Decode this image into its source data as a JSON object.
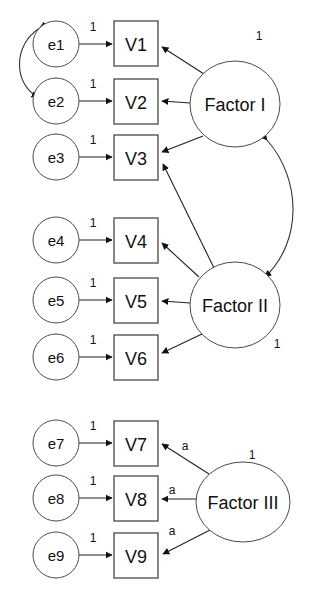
{
  "diagram": {
    "background_color": "#ffffff",
    "line_color": "#222222",
    "shape_fill": "#ffffff",
    "errors": [
      {
        "id": "e1",
        "label": "e1",
        "cx": 56,
        "cy": 44,
        "rx": 23,
        "ry": 23
      },
      {
        "id": "e2",
        "label": "e2",
        "cx": 56,
        "cy": 101,
        "rx": 23,
        "ry": 23
      },
      {
        "id": "e3",
        "label": "e3",
        "cx": 56,
        "cy": 157,
        "rx": 23,
        "ry": 23
      },
      {
        "id": "e4",
        "label": "e4",
        "cx": 56,
        "cy": 240,
        "rx": 23,
        "ry": 23
      },
      {
        "id": "e5",
        "label": "e5",
        "cx": 56,
        "cy": 300,
        "rx": 23,
        "ry": 23
      },
      {
        "id": "e6",
        "label": "e6",
        "cx": 56,
        "cy": 357,
        "rx": 23,
        "ry": 23
      },
      {
        "id": "e7",
        "label": "e7",
        "cx": 56,
        "cy": 443,
        "rx": 23,
        "ry": 23
      },
      {
        "id": "e8",
        "label": "e8",
        "cx": 56,
        "cy": 498,
        "rx": 23,
        "ry": 23
      },
      {
        "id": "e9",
        "label": "e9",
        "cx": 56,
        "cy": 555,
        "rx": 23,
        "ry": 23
      }
    ],
    "variables": [
      {
        "id": "V1",
        "label": "V1",
        "x": 114,
        "y": 21,
        "w": 44,
        "h": 45
      },
      {
        "id": "V2",
        "label": "V2",
        "x": 114,
        "y": 79,
        "w": 44,
        "h": 45
      },
      {
        "id": "V3",
        "label": "V3",
        "x": 114,
        "y": 135,
        "w": 44,
        "h": 45
      },
      {
        "id": "V4",
        "label": "V4",
        "x": 114,
        "y": 218,
        "w": 44,
        "h": 45
      },
      {
        "id": "V5",
        "label": "V5",
        "x": 114,
        "y": 278,
        "w": 44,
        "h": 45
      },
      {
        "id": "V6",
        "label": "V6",
        "x": 114,
        "y": 335,
        "w": 44,
        "h": 45
      },
      {
        "id": "V7",
        "label": "V7",
        "x": 114,
        "y": 421,
        "w": 44,
        "h": 45
      },
      {
        "id": "V8",
        "label": "V8",
        "x": 114,
        "y": 476,
        "w": 44,
        "h": 45
      },
      {
        "id": "V9",
        "label": "V9",
        "x": 114,
        "y": 533,
        "w": 44,
        "h": 45
      }
    ],
    "factors": [
      {
        "id": "F1",
        "label": "Factor I",
        "cx": 235,
        "cy": 104,
        "rx": 45,
        "ry": 43,
        "variance_label": "1",
        "variance_x": 259,
        "variance_y": 36
      },
      {
        "id": "F2",
        "label": "Factor II",
        "cx": 235,
        "cy": 305,
        "rx": 45,
        "ry": 43,
        "variance_label": "1",
        "variance_x": 277,
        "variance_y": 344
      },
      {
        "id": "F3",
        "label": "Factor III",
        "cx": 243,
        "cy": 502,
        "rx": 47,
        "ry": 40,
        "variance_label": "1",
        "variance_x": 252,
        "variance_y": 455
      }
    ],
    "error_paths": [
      {
        "from": "e1",
        "to": "V1",
        "label": "1",
        "label_x": 93,
        "label_y": 31,
        "y": 44
      },
      {
        "from": "e2",
        "to": "V2",
        "label": "1",
        "label_x": 93,
        "label_y": 88,
        "y": 101
      },
      {
        "from": "e3",
        "to": "V3",
        "label": "1",
        "label_x": 93,
        "label_y": 144,
        "y": 157
      },
      {
        "from": "e4",
        "to": "V4",
        "label": "1",
        "label_x": 93,
        "label_y": 227,
        "y": 240
      },
      {
        "from": "e5",
        "to": "V5",
        "label": "1",
        "label_x": 93,
        "label_y": 287,
        "y": 300
      },
      {
        "from": "e6",
        "to": "V6",
        "label": "1",
        "label_x": 93,
        "label_y": 344,
        "y": 357
      },
      {
        "from": "e7",
        "to": "V7",
        "label": "1",
        "label_x": 93,
        "label_y": 430,
        "y": 443
      },
      {
        "from": "e8",
        "to": "V8",
        "label": "1",
        "label_x": 93,
        "label_y": 485,
        "y": 498
      },
      {
        "from": "e9",
        "to": "V9",
        "label": "1",
        "label_x": 93,
        "label_y": 542,
        "y": 555
      }
    ],
    "loadings": [
      {
        "from": "F1",
        "to": "V1",
        "label": "",
        "d": "M 204 74 L 163 46"
      },
      {
        "from": "F1",
        "to": "V2",
        "label": "",
        "d": "M 190 103 L 163 101"
      },
      {
        "from": "F1",
        "to": "V3",
        "label": "",
        "d": "M 203 136 L 163 152"
      },
      {
        "from": "F2",
        "to": "V3",
        "label": "",
        "d": "M 213 270 L 163 163"
      },
      {
        "from": "F2",
        "to": "V4",
        "label": "",
        "d": "M 199 277 L 163 243"
      },
      {
        "from": "F2",
        "to": "V5",
        "label": "",
        "d": "M 190 303 L 163 301"
      },
      {
        "from": "F2",
        "to": "V6",
        "label": "",
        "d": "M 202 334 L 163 353"
      },
      {
        "from": "F3",
        "to": "V7",
        "label": "a",
        "label_x": 183,
        "label_y": 446,
        "d": "M 208 473 L 163 444"
      },
      {
        "from": "F3",
        "to": "V8",
        "label": "a",
        "label_x": 170,
        "label_y": 490,
        "d": "M 196 499 L 163 499"
      },
      {
        "from": "F3",
        "to": "V9",
        "label": "a",
        "label_x": 170,
        "label_y": 531,
        "d": "M 209 530 L 163 554"
      }
    ],
    "covariances": [
      {
        "id": "cov-e1-e2",
        "between": [
          "e1",
          "e2"
        ],
        "label": "",
        "d": "M 40 28 C 12 45 14 85 38 97"
      },
      {
        "id": "cov-F1-F2",
        "between": [
          "Factor I",
          "Factor II"
        ],
        "label": "",
        "d": "M 267 140 C 300 180 300 240 265 277"
      }
    ]
  }
}
